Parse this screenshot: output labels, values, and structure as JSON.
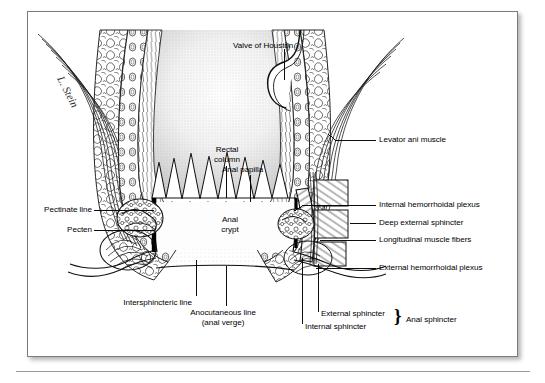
{
  "figure": {
    "artist_signature": "L. Stein",
    "ink_color": "#000000",
    "frame_color": "#7b7b7b",
    "background_color": "#ffffff"
  },
  "labels": {
    "valve_of_houston": "Valve of Houston",
    "levator_ani_muscle": "Levator ani muscle",
    "rectal_column_l1": "Rectal",
    "rectal_column_l2": "column",
    "anal_papilla": "Anal papilla",
    "internal_hemorrhoidal_plexus": "Internal hemorrhoidal plexus",
    "pectinate_line": "Pectinate line",
    "deep_external_sphincter": "Deep external sphincter",
    "pecten": "Pecten",
    "longitudinal_muscle_fibers": "Longitudinal muscle fibers",
    "anal_crypt_l1": "Anal",
    "anal_crypt_l2": "crypt",
    "external_hemorrhoidal_plexus": "External hemorrhoidal plexus",
    "intersphincteric_line": "Intersphincteric line",
    "anocutaneous_line_l1": "Anocutaneous line",
    "anocutaneous_line_l2": "(anal verge)",
    "external_sphincter": "External sphincter",
    "internal_sphincter": "Internal sphincter",
    "anal_sphincter": "Anal sphincter",
    "brace_glyph": "}"
  }
}
